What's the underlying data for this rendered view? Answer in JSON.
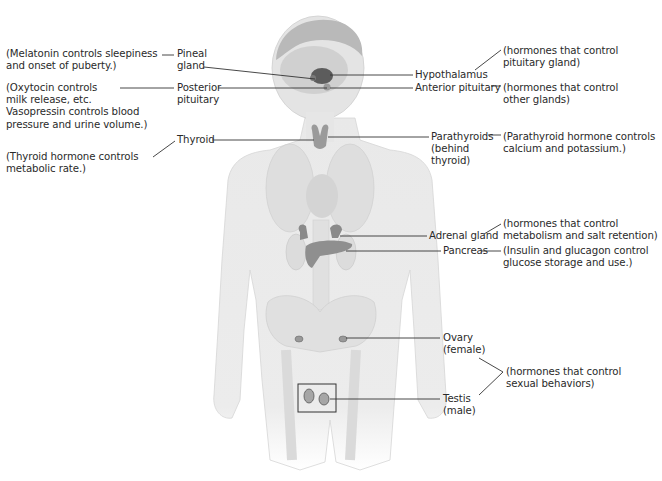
{
  "diagram": {
    "glands": [
      {
        "id": "pineal",
        "name_lines": [
          "Pineal",
          "gland"
        ],
        "function_lines": [
          "(Melatonin controls sleepiness",
          "and onset of puberty.)"
        ]
      },
      {
        "id": "posterior-pituitary",
        "name_lines": [
          "Posterior",
          "pituitary"
        ],
        "function_lines": [
          "(Oxytocin controls",
          "milk release, etc.",
          "Vasopressin controls blood",
          "pressure and urine volume.)"
        ]
      },
      {
        "id": "thyroid",
        "name_lines": [
          "Thyroid"
        ],
        "function_lines": [
          "(Thyroid hormone controls",
          "metabolic rate.)"
        ]
      },
      {
        "id": "hypothalamus",
        "name_lines": [
          "Hypothalamus"
        ],
        "function_lines": [
          "(hormones that control",
          "pituitary gland)"
        ]
      },
      {
        "id": "anterior-pituitary",
        "name_lines": [
          "Anterior pituitary"
        ],
        "function_lines": [
          "(hormones that control",
          "other glands)"
        ]
      },
      {
        "id": "parathyroids",
        "name_lines": [
          "Parathyroids",
          "(behind",
          "thyroid)"
        ],
        "function_lines": [
          "(Parathyroid hormone controls",
          "calcium and potassium.)"
        ]
      },
      {
        "id": "adrenal",
        "name_lines": [
          "Adrenal gland"
        ],
        "function_lines": [
          "(hormones that control",
          "metabolism and salt retention)"
        ]
      },
      {
        "id": "pancreas",
        "name_lines": [
          "Pancreas"
        ],
        "function_lines": [
          "(Insulin and glucagon control",
          "glucose storage and use.)"
        ]
      },
      {
        "id": "ovary",
        "name_lines": [
          "Ovary",
          "(female)"
        ],
        "function_lines": []
      },
      {
        "id": "testis",
        "name_lines": [
          "Testis",
          "(male)"
        ],
        "function_lines": []
      }
    ],
    "shared_function": {
      "applies_to": [
        "ovary",
        "testis"
      ],
      "lines": [
        "(hormones that control",
        "sexual behaviors)"
      ]
    }
  },
  "colors": {
    "text": "#2a2a2a",
    "leader_lines": "#333333",
    "body_fill": "#eeeeee",
    "gland_fill": "#8a8a8a"
  }
}
